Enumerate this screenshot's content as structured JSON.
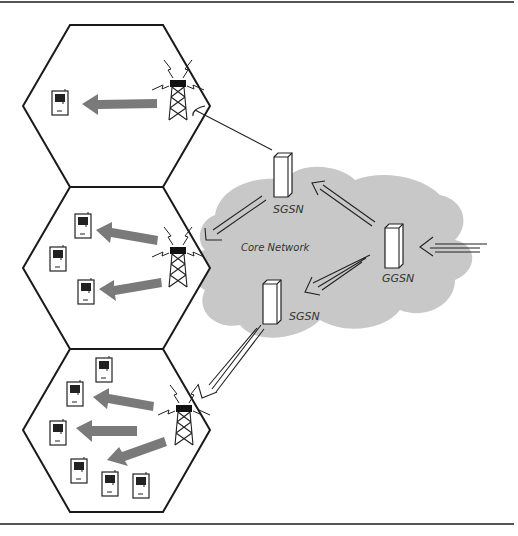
{
  "diagram": {
    "title": "",
    "labels": {
      "core_network": "Core Network",
      "sgsn_top": "SGSN",
      "sgsn_bottom": "SGSN",
      "ggsn": "GGSN"
    },
    "colors": {
      "cloud": "#c8c8c8",
      "arrow": "#7a7a7a",
      "line": "#1a1a1a",
      "rule": "#555555"
    },
    "cells": [
      {
        "name": "cell-top",
        "devices": 1,
        "signal_arrows": 1
      },
      {
        "name": "cell-middle",
        "devices": 3,
        "signal_arrows": 2
      },
      {
        "name": "cell-bottom",
        "devices": 8,
        "signal_arrows": 3
      }
    ],
    "nodes": [
      {
        "id": "sgsn-top",
        "label": "SGSN"
      },
      {
        "id": "ggsn",
        "label": "GGSN"
      },
      {
        "id": "sgsn-bottom",
        "label": "SGSN"
      }
    ],
    "edges": [
      {
        "from": "ggsn",
        "to": "sgsn-top"
      },
      {
        "from": "ggsn",
        "to": "sgsn-bottom"
      },
      {
        "from": "sgsn-top",
        "to": "cell-middle"
      },
      {
        "from": "sgsn-top",
        "to": "cell-top"
      },
      {
        "from": "sgsn-bottom",
        "to": "cell-bottom"
      },
      {
        "from": "external",
        "to": "ggsn"
      }
    ]
  }
}
